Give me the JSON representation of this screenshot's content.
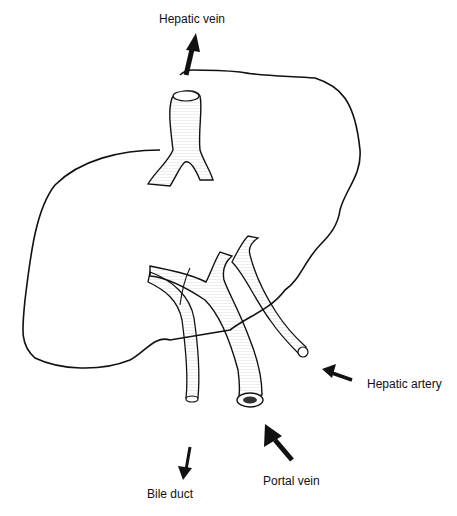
{
  "diagram": {
    "labels": {
      "hepatic_vein": "Hepatic vein",
      "hepatic_artery": "Hepatic artery",
      "portal_vein": "Portal  vein",
      "bile_duct": "Bile duct"
    },
    "flow": [
      {
        "structure": "Hepatic vein",
        "direction": "out"
      },
      {
        "structure": "Hepatic artery",
        "direction": "in"
      },
      {
        "structure": "Portal vein",
        "direction": "in"
      },
      {
        "structure": "Bile duct",
        "direction": "out"
      }
    ],
    "colors": {
      "line": "#111111",
      "background": "#ffffff"
    }
  }
}
